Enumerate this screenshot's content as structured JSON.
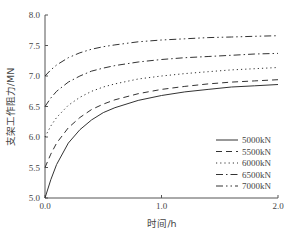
{
  "chart_data": {
    "type": "line",
    "title": "",
    "xlabel": "时间/h",
    "ylabel": "支架工作阻力/MN",
    "xlim": [
      0.0,
      2.0
    ],
    "ylim": [
      5.0,
      8.0
    ],
    "xticks": [
      "0.0",
      "1.0",
      "2.0"
    ],
    "yticks": [
      "5.0",
      "5.5",
      "6.0",
      "6.5",
      "7.0",
      "7.5",
      "8.0"
    ],
    "grid": false,
    "legend_position": "lower right",
    "x": [
      0.0,
      0.05,
      0.1,
      0.2,
      0.3,
      0.4,
      0.5,
      0.6,
      0.8,
      1.0,
      1.2,
      1.4,
      1.6,
      1.8,
      2.0
    ],
    "series": [
      {
        "name": "5000kN",
        "style": "solid",
        "values": [
          5.0,
          5.3,
          5.55,
          5.9,
          6.12,
          6.28,
          6.4,
          6.48,
          6.6,
          6.68,
          6.74,
          6.78,
          6.82,
          6.84,
          6.86
        ]
      },
      {
        "name": "5500kN",
        "style": "dashed",
        "values": [
          5.5,
          5.72,
          5.9,
          6.15,
          6.32,
          6.45,
          6.54,
          6.61,
          6.71,
          6.78,
          6.83,
          6.87,
          6.9,
          6.92,
          6.94
        ]
      },
      {
        "name": "6000kN",
        "style": "dotted",
        "values": [
          6.0,
          6.18,
          6.32,
          6.52,
          6.65,
          6.75,
          6.82,
          6.87,
          6.95,
          7.0,
          7.04,
          7.07,
          7.1,
          7.12,
          7.14
        ]
      },
      {
        "name": "6500kN",
        "style": "dashdot",
        "values": [
          6.5,
          6.64,
          6.75,
          6.9,
          7.0,
          7.08,
          7.13,
          7.17,
          7.23,
          7.27,
          7.3,
          7.32,
          7.34,
          7.36,
          7.37
        ]
      },
      {
        "name": "7000kN",
        "style": "dashdotdot",
        "values": [
          7.0,
          7.1,
          7.18,
          7.3,
          7.38,
          7.44,
          7.48,
          7.51,
          7.56,
          7.59,
          7.61,
          7.63,
          7.64,
          7.65,
          7.66
        ]
      }
    ]
  },
  "colors": {
    "line": "#333333",
    "axis": "#555555",
    "text": "#444444"
  }
}
